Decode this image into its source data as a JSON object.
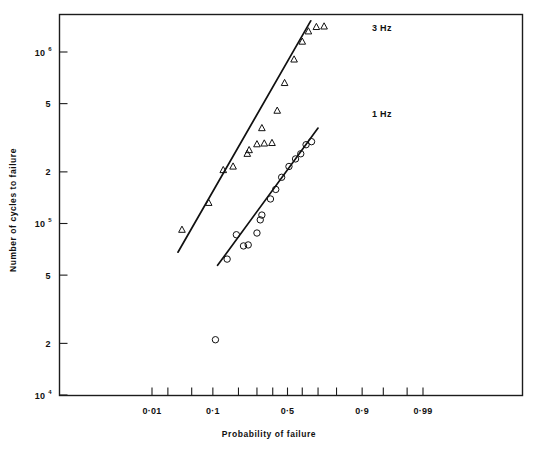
{
  "chart_data": {
    "type": "scatter",
    "title": "",
    "xlabel": "Probability of failure",
    "ylabel": "Number of cycles to failure",
    "x_scale": "probability",
    "y_scale": "log",
    "grid": false,
    "legend_position": "inline-right",
    "xlim": [
      0.004,
      0.995
    ],
    "ylim": [
      10000,
      1600000
    ],
    "x_tick_labels": [
      "0·01",
      "0·1",
      "0·5",
      "0·9",
      "0·99"
    ],
    "x_tick_values": [
      0.01,
      0.1,
      0.5,
      0.9,
      0.99
    ],
    "x_minor_tick_values": [
      0.02,
      0.05,
      0.2,
      0.3,
      0.4,
      0.6,
      0.7,
      0.8,
      0.95,
      0.98
    ],
    "y_tick_labels": [
      "10",
      "5",
      "2",
      "10",
      "5",
      "2",
      "10"
    ],
    "y_tick_exponents": [
      "6",
      "",
      "",
      "5",
      "",
      "",
      "4"
    ],
    "y_tick_values": [
      1000000,
      500000,
      200000,
      100000,
      50000,
      20000,
      10000
    ],
    "series": [
      {
        "name": "3 Hz",
        "label": "3 Hz",
        "marker": "triangle",
        "points": [
          {
            "p": 0.035,
            "n": 92000
          },
          {
            "p": 0.088,
            "n": 132000
          },
          {
            "p": 0.135,
            "n": 205000
          },
          {
            "p": 0.175,
            "n": 215000
          },
          {
            "p": 0.245,
            "n": 255000
          },
          {
            "p": 0.255,
            "n": 268000
          },
          {
            "p": 0.3,
            "n": 290000
          },
          {
            "p": 0.345,
            "n": 293000
          },
          {
            "p": 0.395,
            "n": 295000
          },
          {
            "p": 0.33,
            "n": 360000
          },
          {
            "p": 0.43,
            "n": 455000
          },
          {
            "p": 0.48,
            "n": 660000
          },
          {
            "p": 0.545,
            "n": 905000
          },
          {
            "p": 0.6,
            "n": 1150000
          },
          {
            "p": 0.64,
            "n": 1320000
          },
          {
            "p": 0.69,
            "n": 1400000
          },
          {
            "p": 0.735,
            "n": 1410000
          }
        ],
        "fit_line": {
          "p_start": 0.03,
          "n_start": 68000,
          "p_end": 0.655,
          "n_end": 1520000
        }
      },
      {
        "name": "1 Hz",
        "label": "1 Hz",
        "marker": "circle",
        "points": [
          {
            "p": 0.108,
            "n": 21000
          },
          {
            "p": 0.15,
            "n": 62000
          },
          {
            "p": 0.225,
            "n": 74000
          },
          {
            "p": 0.25,
            "n": 75000
          },
          {
            "p": 0.19,
            "n": 86000
          },
          {
            "p": 0.3,
            "n": 88000
          },
          {
            "p": 0.32,
            "n": 105000
          },
          {
            "p": 0.33,
            "n": 112000
          },
          {
            "p": 0.385,
            "n": 139000
          },
          {
            "p": 0.42,
            "n": 158000
          },
          {
            "p": 0.46,
            "n": 186000
          },
          {
            "p": 0.51,
            "n": 215000
          },
          {
            "p": 0.555,
            "n": 238000
          },
          {
            "p": 0.59,
            "n": 255000
          },
          {
            "p": 0.625,
            "n": 288000
          },
          {
            "p": 0.66,
            "n": 300000
          }
        ],
        "fit_line": {
          "p_start": 0.115,
          "n_start": 57000,
          "p_end": 0.7,
          "n_end": 360000
        }
      }
    ]
  },
  "labels": {
    "x_axis_title": "Probability of failure",
    "y_axis_title": "Number of cycles to failure",
    "series_3hz": "3 Hz",
    "series_1hz": "1 Hz"
  }
}
